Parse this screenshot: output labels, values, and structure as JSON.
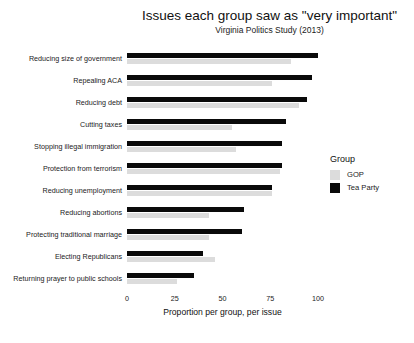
{
  "chart_data": {
    "type": "bar",
    "orientation": "horizontal",
    "title": "Issues each group saw as \"very important\"",
    "subtitle": "Virginia Politics Study (2013)",
    "xlabel": "Proportion per group, per issue",
    "ylabel": "",
    "xlim": [
      0,
      100
    ],
    "xticks": [
      "0",
      "25",
      "50",
      "75",
      "100"
    ],
    "grid": false,
    "legend": {
      "title": "Group",
      "position": "right",
      "entries": [
        {
          "name": "GOP",
          "color": "#dcdcdc"
        },
        {
          "name": "Tea Party",
          "color": "#0a0a0a"
        }
      ]
    },
    "categories": [
      "Reducing size of government",
      "Repealing ACA",
      "Reducing debt",
      "Cutting taxes",
      "Stopping illegal immigration",
      "Protection from terrorism",
      "Reducing unemployment",
      "Reducing abortions",
      "Protecting traditional marriage",
      "Electing Republicans",
      "Returning prayer to public schools"
    ],
    "series": [
      {
        "name": "Tea Party",
        "color": "#0a0a0a",
        "values": [
          100,
          97,
          94,
          83,
          81,
          81,
          76,
          61,
          60,
          40,
          35
        ]
      },
      {
        "name": "GOP",
        "color": "#dcdcdc",
        "values": [
          86,
          76,
          90,
          55,
          57,
          80,
          76,
          43,
          43,
          46,
          26
        ]
      }
    ]
  }
}
